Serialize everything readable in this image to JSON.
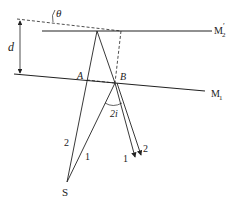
{
  "diagram": {
    "type": "thin-film / tilted-mirror interference schematic",
    "mirrors": {
      "m2_prime": {
        "label": "M",
        "sub": "2",
        "prime": "′"
      },
      "m1": {
        "label": "M",
        "sub": "1"
      }
    },
    "labels": {
      "theta": "θ",
      "d": "d",
      "A": "A",
      "B": "B",
      "angle": "2i",
      "source": "S"
    },
    "rays": {
      "incident_1": "1",
      "incident_2": "2",
      "reflected_1": "1",
      "reflected_2": "2"
    },
    "colors": {
      "line": "#222222",
      "background": "#ffffff"
    }
  }
}
